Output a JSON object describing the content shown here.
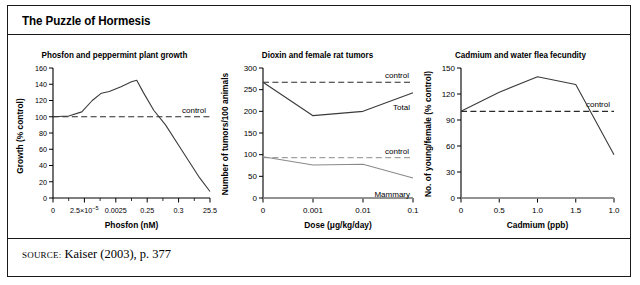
{
  "figure": {
    "title": "The Puzzle of Hormesis",
    "source_label": "SOURCE:",
    "source_text": " Kaiser (2003), p. 377"
  },
  "chart_data": [
    {
      "type": "line",
      "title": "Phosfon and peppermint plant growth",
      "xlabel": "Phosfon (nM)",
      "ylabel": "Growth (% control)",
      "ylim": [
        0,
        160
      ],
      "yticks": [
        0,
        20,
        40,
        60,
        80,
        100,
        120,
        140,
        160
      ],
      "xtick_labels": [
        "0",
        "2.5×10⁻⁵",
        "0.0025",
        "0.25",
        "0.3",
        "25.5"
      ],
      "grid": false,
      "legend_position": "inline",
      "series": [
        {
          "name": "Growth",
          "x": [
            0.0,
            0.6,
            1.1,
            1.5,
            1.85,
            2.15,
            2.6,
            3.0,
            3.2,
            3.45,
            3.85,
            4.3,
            4.8,
            5.2,
            5.6,
            6.0
          ],
          "values": [
            100,
            101,
            106,
            120,
            129,
            131,
            137,
            143,
            145,
            130,
            108,
            90,
            65,
            45,
            25,
            8
          ]
        }
      ],
      "annotations": [
        {
          "name": "control",
          "label": "control",
          "value": 100,
          "style": "dashed"
        }
      ]
    },
    {
      "type": "line",
      "title": "Dioxin and female rat tumors",
      "xlabel": "Dose (μg/kg/day)",
      "ylabel": "Number of tumors/100 animals",
      "ylim": [
        0,
        300
      ],
      "yticks": [
        0,
        50,
        100,
        150,
        200,
        250,
        300
      ],
      "xtick_labels": [
        "0",
        "0.001",
        "0.01",
        "0.1"
      ],
      "grid": false,
      "legend_position": "inline",
      "series": [
        {
          "name": "Total",
          "x": [
            0,
            1,
            2,
            3
          ],
          "values": [
            267,
            190,
            200,
            243
          ]
        },
        {
          "name": "Mammary",
          "x": [
            0,
            1,
            2,
            3
          ],
          "values": [
            95,
            76,
            78,
            46
          ]
        }
      ],
      "annotations": [
        {
          "name": "control-total",
          "label": "control",
          "value": 267,
          "style": "dashed"
        },
        {
          "name": "control-mammary",
          "label": "control",
          "value": 93,
          "style": "dashed"
        }
      ]
    },
    {
      "type": "line",
      "title": "Cadmium and water flea fecundity",
      "xlabel": "Cadmium (ppb)",
      "ylabel": "No. of young/female (% control)",
      "ylim": [
        0,
        150
      ],
      "yticks": [
        0,
        30,
        60,
        90,
        120,
        150
      ],
      "xtick_labels": [
        "0",
        "0.5",
        "1.0",
        "1.5",
        "1.0"
      ],
      "grid": false,
      "legend_position": "inline",
      "series": [
        {
          "name": "Fecundity",
          "x": [
            0.0,
            0.5,
            1.0,
            1.5,
            2.0
          ],
          "values": [
            100,
            122,
            140,
            131,
            50
          ]
        }
      ],
      "annotations": [
        {
          "name": "control",
          "label": "control",
          "value": 100,
          "style": "dashed"
        }
      ]
    }
  ]
}
